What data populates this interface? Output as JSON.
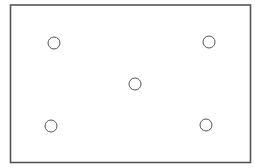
{
  "diagram": {
    "type": "dot-pattern",
    "colors": {
      "background": "#ffffff",
      "stroke": "#555555"
    },
    "frame": {
      "x": 10.5,
      "y": 5,
      "width": 240,
      "height": 157.5,
      "stroke_width": 1.6
    },
    "circles": [
      {
        "id": "top-left",
        "cx": 54,
        "cy": 43,
        "r": 6
      },
      {
        "id": "top-right",
        "cx": 209,
        "cy": 42,
        "r": 6
      },
      {
        "id": "center",
        "cx": 135,
        "cy": 84,
        "r": 6
      },
      {
        "id": "bottom-left",
        "cx": 51,
        "cy": 126,
        "r": 6
      },
      {
        "id": "bottom-right",
        "cx": 206,
        "cy": 125,
        "r": 6
      }
    ]
  }
}
